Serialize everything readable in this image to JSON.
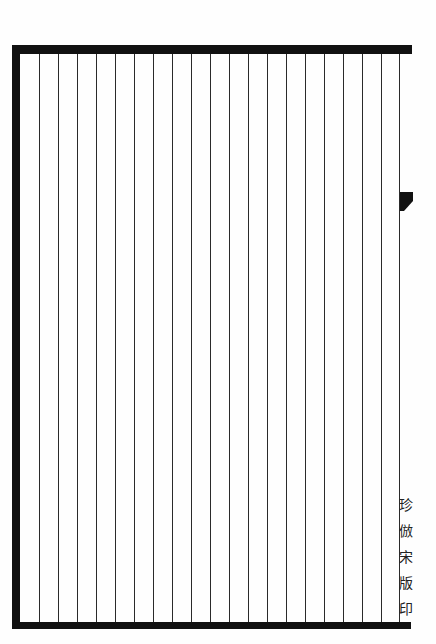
{
  "page": {
    "type": "blank ruled woodblock-style page",
    "column_count": 20,
    "colors": {
      "ink": "#111111",
      "paper": "#fefefe"
    }
  },
  "footer": {
    "page_number": "一",
    "imprint_chars": [
      "珍",
      "倣",
      "宋",
      "版",
      "印"
    ]
  }
}
